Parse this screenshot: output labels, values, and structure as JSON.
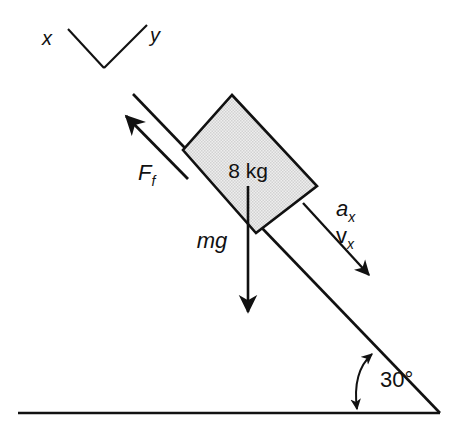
{
  "diagram": {
    "block": {
      "mass_label": "8 kg",
      "fill_color": "#e2e2e2",
      "stroke_color": "#111111"
    },
    "forces": [
      {
        "id": "friction",
        "label_main": "F",
        "label_sub": "f",
        "direction": "up-the-incline"
      },
      {
        "id": "weight",
        "label_main": "mg",
        "label_sub": "",
        "direction": "straight-down"
      }
    ],
    "kinematics": [
      {
        "id": "acceleration",
        "label_main": "a",
        "label_sub": "x",
        "direction": "down-the-incline"
      },
      {
        "id": "velocity",
        "label_main": "v",
        "label_sub": "x",
        "direction": "down-the-incline"
      }
    ],
    "axes": {
      "x_label": "x",
      "y_label": "y"
    },
    "angle": {
      "value": "30°",
      "between": "incline-and-ground"
    },
    "ground": {
      "label": ""
    }
  }
}
